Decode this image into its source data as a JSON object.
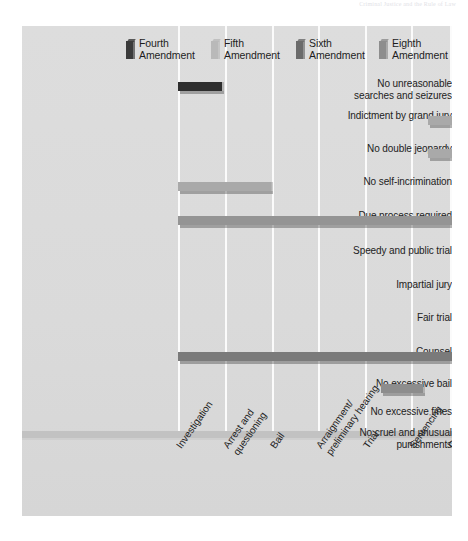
{
  "page_header": "Criminal Justice and the Rule of Law",
  "legend": {
    "items": [
      {
        "label": "Fourth\nAmendment",
        "color": "#3b3b3b",
        "swatch_name": "legend-swatch-fourth",
        "x": 0
      },
      {
        "label": "Fifth\nAmendment",
        "color": "#b9b9b9",
        "swatch_name": "legend-swatch-fifth",
        "x": 85
      },
      {
        "label": "Sixth\nAmendment",
        "color": "#6b6b6b",
        "swatch_name": "legend-swatch-sixth",
        "x": 170
      },
      {
        "label": "Eighth\nAmendment",
        "color": "#8d8d8d",
        "swatch_name": "legend-swatch-eighth",
        "x": 253
      }
    ]
  },
  "axis": {
    "stages": [
      "Investigation",
      "Arrest and\nquestioning",
      "Bail",
      "Arraignment/\npreliminary hearing",
      "Trial",
      "Sentencing",
      "Corrections"
    ],
    "gridlines_x": [
      156,
      203,
      250,
      296,
      343,
      389,
      428
    ]
  },
  "chart_data": {
    "type": "bar",
    "orientation": "horizontal",
    "xlabel": "",
    "ylabel": "",
    "grid": true,
    "legend_position": "top",
    "categories": [
      "No unreasonable searches and seizures",
      "Indictment by grand jury",
      "No double jeopardy",
      "No self-incrimination",
      "Due process required",
      "Speedy and public trial",
      "Impartial jury",
      "Fair trial",
      "Counsel",
      "No excessive bail",
      "No excessive fines",
      "No cruel and unusual punishments"
    ],
    "stages": [
      "Investigation",
      "Arrest and questioning",
      "Bail",
      "Arraignment/preliminary hearing",
      "Trial",
      "Sentencing",
      "Corrections"
    ],
    "series": [
      {
        "name": "Fourth Amendment",
        "color": "#3b3b3b"
      },
      {
        "name": "Fifth Amendment",
        "color": "#b9b9b9"
      },
      {
        "name": "Sixth Amendment",
        "color": "#6b6b6b"
      },
      {
        "name": "Eighth Amendment",
        "color": "#8d8d8d"
      }
    ],
    "bars": [
      {
        "row": 0,
        "label": "No unreasonable searches and seizures",
        "amendment": "Fourth Amendment",
        "color": "#2e2e2e",
        "start_stage": 0,
        "end_stage": 0,
        "x": 0,
        "width": 44
      },
      {
        "row": 1,
        "label": "Indictment by grand jury",
        "amendment": "Fifth Amendment",
        "color": "#a9a9a9",
        "start_stage": 3,
        "end_stage": 3,
        "x": 250,
        "width": 42
      },
      {
        "row": 2,
        "label": "No double jeopardy",
        "amendment": "Fifth Amendment",
        "color": "#a9a9a9",
        "start_stage": 3,
        "end_stage": 4,
        "x": 250,
        "width": 88
      },
      {
        "row": 3,
        "label": "No self-incrimination",
        "amendment": "Fifth Amendment",
        "color": "#a9a9a9",
        "start_stage": 0,
        "end_stage": 1,
        "x": 0,
        "width": 93
      },
      {
        "row": 3,
        "label": "No self-incrimination (trial)",
        "amendment": "Sixth Amendment",
        "color": "#777777",
        "start_stage": 4,
        "end_stage": 4,
        "x": 296,
        "width": 42
      },
      {
        "row": 4,
        "label": "Due process required",
        "amendment": "Fifth Amendment",
        "color": "#949494",
        "start_stage": 0,
        "end_stage": 6,
        "x": 0,
        "width": 428
      },
      {
        "row": 5,
        "label": "Speedy and public trial",
        "amendment": "Sixth Amendment",
        "color": "#6f6f6f",
        "start_stage": 4,
        "end_stage": 4,
        "x": 296,
        "width": 42
      },
      {
        "row": 6,
        "label": "Impartial jury",
        "amendment": "Sixth Amendment",
        "color": "#6f6f6f",
        "start_stage": 4,
        "end_stage": 4,
        "x": 296,
        "width": 42
      },
      {
        "row": 7,
        "label": "Fair trial",
        "amendment": "Sixth Amendment",
        "color": "#6f6f6f",
        "start_stage": 4,
        "end_stage": 4,
        "x": 296,
        "width": 42
      },
      {
        "row": 8,
        "label": "Counsel",
        "amendment": "Sixth Amendment",
        "color": "#7a7a7a",
        "start_stage": 0,
        "end_stage": 5,
        "x": 0,
        "width": 389
      },
      {
        "row": 9,
        "label": "No excessive bail",
        "amendment": "Eighth Amendment",
        "color": "#8d8d8d",
        "start_stage": 2,
        "end_stage": 2,
        "x": 203,
        "width": 42
      },
      {
        "row": 10,
        "label": "No excessive fines",
        "amendment": "Eighth Amendment",
        "color": "#8d8d8d",
        "start_stage": 5,
        "end_stage": 5,
        "x": 343,
        "width": 42
      },
      {
        "row": 11,
        "label": "No cruel and unusual punishments",
        "amendment": "Eighth Amendment",
        "color": "#8d8d8d",
        "start_stage": 5,
        "end_stage": 6,
        "x": 343,
        "width": 87
      }
    ]
  },
  "rows": [
    {
      "label": "No unreasonable\nsearches and seizures",
      "y": 56,
      "label_y": 52
    },
    {
      "label": "Indictment by grand jury",
      "y": 90,
      "label_y": 84
    },
    {
      "label": "No double jeopardy",
      "y": 123,
      "label_y": 117
    },
    {
      "label": "No self-incrimination",
      "y": 156,
      "label_y": 150
    },
    {
      "label": "Due process required",
      "y": 190,
      "label_y": 184
    },
    {
      "label": "Speedy and public trial",
      "y": 225,
      "label_y": 219
    },
    {
      "label": "Impartial jury",
      "y": 259,
      "label_y": 253
    },
    {
      "label": "Fair trial",
      "y": 292,
      "label_y": 286
    },
    {
      "label": "Counsel",
      "y": 326,
      "label_y": 320
    },
    {
      "label": "No excessive bail",
      "y": 358,
      "label_y": 352
    },
    {
      "label": "No excessive fines",
      "y": 386,
      "label_y": 380
    },
    {
      "label": "No cruel and unusual\npunishments",
      "y": 413,
      "label_y": 401
    }
  ],
  "xlabel_positions": [
    {
      "x": 152,
      "y": 6
    },
    {
      "x": 199,
      "y": 6
    },
    {
      "x": 246,
      "y": 6
    },
    {
      "x": 292,
      "y": 6
    },
    {
      "x": 339,
      "y": 6
    },
    {
      "x": 385,
      "y": 6
    },
    {
      "x": 424,
      "y": 6
    }
  ]
}
